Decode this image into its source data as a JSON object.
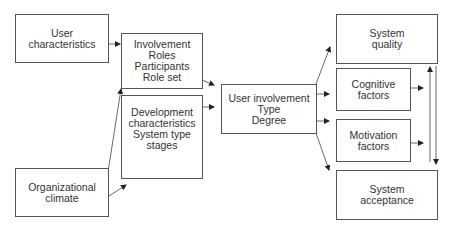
{
  "diagram": {
    "nodes": {
      "user_characteristics": {
        "lines": [
          "User",
          "characteristics"
        ]
      },
      "involvement": {
        "lines": [
          "Involvement",
          "Roles",
          "Participants",
          "Role set"
        ]
      },
      "development": {
        "lines": [
          "Development",
          "characteristics",
          "System type",
          "stages"
        ]
      },
      "organizational_climate": {
        "lines": [
          "Organizational",
          "climate"
        ]
      },
      "user_involvement": {
        "lines": [
          "User involvement",
          "Type",
          "Degree"
        ]
      },
      "system_quality": {
        "lines": [
          "System",
          "quality"
        ]
      },
      "cognitive_factors": {
        "lines": [
          "Cognitive",
          "factors"
        ]
      },
      "motivation_factors": {
        "lines": [
          "Motivation",
          "factors"
        ]
      },
      "system_acceptance": {
        "lines": [
          "System",
          "acceptance"
        ]
      }
    },
    "edges": [
      {
        "from": "user_characteristics",
        "to": "involvement"
      },
      {
        "from": "organizational_climate",
        "to": "involvement"
      },
      {
        "from": "organizational_climate",
        "to": "development"
      },
      {
        "from": "involvement",
        "to": "user_involvement"
      },
      {
        "from": "development",
        "to": "user_involvement"
      },
      {
        "from": "user_involvement",
        "to": "system_quality"
      },
      {
        "from": "user_involvement",
        "to": "cognitive_factors"
      },
      {
        "from": "user_involvement",
        "to": "motivation_factors"
      },
      {
        "from": "user_involvement",
        "to": "system_acceptance"
      },
      {
        "from": "cognitive_factors",
        "to": "feedback_line"
      },
      {
        "from": "motivation_factors",
        "to": "feedback_line"
      },
      {
        "from": "system_acceptance",
        "to": "system_quality",
        "label": "upward arrow"
      },
      {
        "from": "system_quality",
        "to": "system_acceptance",
        "label": "downward arrow"
      }
    ],
    "colors": {
      "stroke": "#555555",
      "text": "#333333",
      "background": "#ffffff"
    }
  }
}
